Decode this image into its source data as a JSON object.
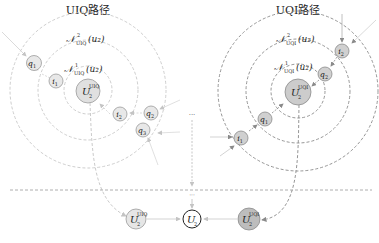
{
  "titles": {
    "left": "UIQ路径",
    "right": "UQI路径"
  },
  "left_panel": {
    "ring_labels": {
      "outer": {
        "sym": "𝒩",
        "sup": "2",
        "sub": "UIQ",
        "arg": "(u₂)"
      },
      "inner": {
        "sym": "𝒩",
        "sup": "1",
        "sub": "UIQ",
        "arg": "(u₂)"
      }
    },
    "center_node": {
      "base": "U",
      "sub": "2",
      "sup": "UIQ"
    },
    "nodes": [
      {
        "base": "q",
        "sub": "1"
      },
      {
        "base": "i",
        "sub": "1"
      },
      {
        "base": "i",
        "sub": "2"
      },
      {
        "base": "q",
        "sub": "2"
      },
      {
        "base": "q",
        "sub": "3"
      }
    ]
  },
  "right_panel": {
    "ring_labels": {
      "outer": {
        "sym": "𝒩",
        "sup": "2",
        "sub": "UQI",
        "arg": "(u₂)"
      },
      "inner": {
        "sym": "𝒩",
        "sup": "1",
        "sub": "UQI",
        "arg": "(u₂)"
      }
    },
    "center_node": {
      "base": "U",
      "sub": "2",
      "sup": "UQI"
    },
    "nodes": [
      {
        "base": "i",
        "sub": "2"
      },
      {
        "base": "q",
        "sub": "2"
      },
      {
        "base": "q",
        "sub": "1"
      },
      {
        "base": "i",
        "sub": "1"
      }
    ]
  },
  "middle": {
    "ellipsis_top": "···",
    "ellipsis_bottom": "···"
  },
  "bottom": {
    "uiq_node": {
      "base": "U",
      "sub": "2",
      "sup": "UIQ"
    },
    "final_node": {
      "base": "U",
      "sub": "2"
    },
    "uqi_node": {
      "base": "U",
      "sub": "2",
      "sup": "UQI"
    }
  },
  "colors": {
    "uiq_node_fill": "#e6e6e6",
    "uqi_node_fill": "#c8c8c8",
    "ring_stroke": "#bdbdbd",
    "ring_stroke_dark": "#8a8a8a",
    "arrow": "#b8b8b8",
    "final_node_stroke": "#222222"
  }
}
